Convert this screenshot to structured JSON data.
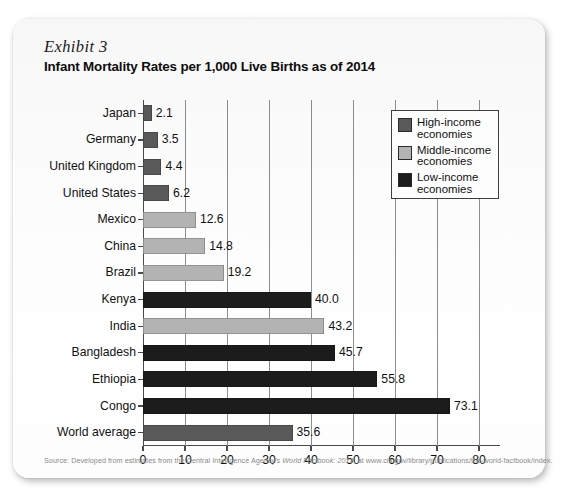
{
  "exhibit": {
    "label": "Exhibit 3",
    "title": "Infant Mortality Rates per 1,000 Live Births as of 2014"
  },
  "source": {
    "prefix": "Source: Developed from estimates from the Central Intelligence Agency's ",
    "italic": "World Factbook: 2015",
    "suffix": ", at www.cia.gov/library/publications/the-world-factbook/index."
  },
  "legend": {
    "items": [
      {
        "label": "High-income\neconomies",
        "color": "#595959",
        "key": "high"
      },
      {
        "label": "Middle-income\neconomies",
        "color": "#b3b3b3",
        "key": "middle"
      },
      {
        "label": "Low-income\neconomies",
        "color": "#1c1c1c",
        "key": "low"
      }
    ]
  },
  "colors": {
    "high_income": "#595959",
    "middle_income": "#b3b3b3",
    "low_income": "#1c1c1c",
    "axis": "#4a4a4a",
    "gridline": "#8c8c8c"
  },
  "chart_data": {
    "type": "bar",
    "orientation": "horizontal",
    "title": "Infant Mortality Rates per 1,000 Live Births as of 2014",
    "xlabel": "",
    "ylabel": "",
    "xlim": [
      0,
      85
    ],
    "xticks": [
      0,
      10,
      20,
      30,
      40,
      50,
      60,
      70,
      80
    ],
    "xticklabels": [
      "0",
      "10",
      "20",
      "30",
      "40",
      "50",
      "60",
      "70",
      "80"
    ],
    "grid": true,
    "legend_position": "upper right",
    "categories": [
      "Japan",
      "Germany",
      "United Kingdom",
      "United States",
      "Mexico",
      "China",
      "Brazil",
      "Kenya",
      "India",
      "Bangladesh",
      "Ethiopia",
      "Congo",
      "World average"
    ],
    "values": [
      2.1,
      3.5,
      4.4,
      6.2,
      12.6,
      14.8,
      19.2,
      40.0,
      43.2,
      45.7,
      55.8,
      73.1,
      35.6
    ],
    "value_labels": [
      "2.1",
      "3.5",
      "4.4",
      "6.2",
      "12.6",
      "14.8",
      "19.2",
      "40.0",
      "43.2",
      "45.7",
      "55.8",
      "73.1",
      "35.6"
    ],
    "groups": [
      "high",
      "high",
      "high",
      "high",
      "middle",
      "middle",
      "middle",
      "low",
      "middle",
      "low",
      "low",
      "low",
      "high"
    ],
    "series": [
      {
        "name": "High-income economies",
        "color": "#595959",
        "points": [
          {
            "category": "Japan",
            "value": 2.1
          },
          {
            "category": "Germany",
            "value": 3.5
          },
          {
            "category": "United Kingdom",
            "value": 4.4
          },
          {
            "category": "United States",
            "value": 6.2
          },
          {
            "category": "World average",
            "value": 35.6
          }
        ]
      },
      {
        "name": "Middle-income economies",
        "color": "#b3b3b3",
        "points": [
          {
            "category": "Mexico",
            "value": 12.6
          },
          {
            "category": "China",
            "value": 14.8
          },
          {
            "category": "Brazil",
            "value": 19.2
          },
          {
            "category": "India",
            "value": 43.2
          }
        ]
      },
      {
        "name": "Low-income economies",
        "color": "#1c1c1c",
        "points": [
          {
            "category": "Kenya",
            "value": 40.0
          },
          {
            "category": "Bangladesh",
            "value": 45.7
          },
          {
            "category": "Ethiopia",
            "value": 55.8
          },
          {
            "category": "Congo",
            "value": 73.1
          }
        ]
      }
    ]
  }
}
